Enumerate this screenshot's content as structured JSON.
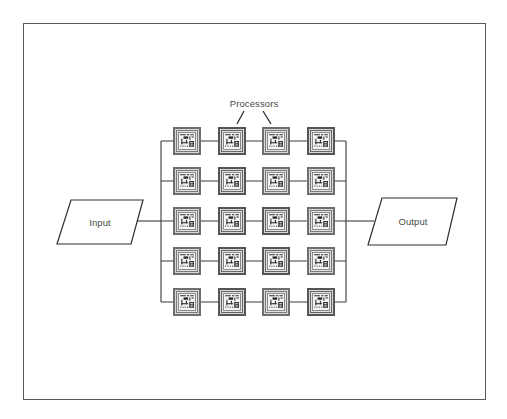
{
  "diagram": {
    "title_label": "Processors",
    "input_label": "Input",
    "output_label": "Output",
    "grid": {
      "rows": 5,
      "columns": 4,
      "node_type": "processor-chip-icon"
    },
    "colors": {
      "line": "#3a3a3a",
      "frame": "#5a5a5a",
      "text": "#4a4a4a",
      "chip_outer": "#6e6e6e",
      "chip_core": "#f4f4f4"
    }
  }
}
